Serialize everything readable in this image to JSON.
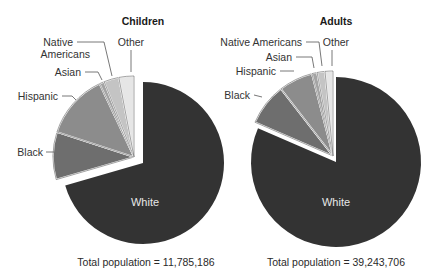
{
  "chart_data": [
    {
      "type": "pie",
      "title": "Children",
      "total_label": "Total population = 11,785,186",
      "total_population": 11785186,
      "start_angle": "12 o'clock, clockwise",
      "exploded": true,
      "slices": [
        {
          "name": "White",
          "value": 70.5,
          "color": "#333333"
        },
        {
          "name": "Black",
          "value": 9.5,
          "color": "#6e6e6e"
        },
        {
          "name": "Hispanic",
          "value": 13.0,
          "color": "#8c8c8c"
        },
        {
          "name": "Asian",
          "value": 1.0,
          "color": "#a4a4a4"
        },
        {
          "name": "Native Americans",
          "value": 3.0,
          "color": "#c4c4c4"
        },
        {
          "name": "Other",
          "value": 3.0,
          "color": "#e6e6e6"
        }
      ],
      "labels": {
        "white": "White",
        "black": "Black",
        "hispanic": "Hispanic",
        "asian": "Asian",
        "native_line1": "Native",
        "native_line2": "Americans",
        "other": "Other"
      }
    },
    {
      "type": "pie",
      "title": "Adults",
      "total_label": "Total population = 39,243,706",
      "total_population": 39243706,
      "start_angle": "12 o'clock, clockwise",
      "exploded": true,
      "slices": [
        {
          "name": "White",
          "value": 81.5,
          "color": "#333333"
        },
        {
          "name": "Black",
          "value": 8.0,
          "color": "#6e6e6e"
        },
        {
          "name": "Hispanic",
          "value": 6.5,
          "color": "#8c8c8c"
        },
        {
          "name": "Asian",
          "value": 1.0,
          "color": "#a4a4a4"
        },
        {
          "name": "Native Americans",
          "value": 1.5,
          "color": "#c4c4c4"
        },
        {
          "name": "Other",
          "value": 1.5,
          "color": "#e6e6e6"
        }
      ],
      "labels": {
        "white": "White",
        "black": "Black",
        "hispanic": "Hispanic",
        "asian": "Asian",
        "native": "Native Americans",
        "other": "Other"
      }
    }
  ]
}
